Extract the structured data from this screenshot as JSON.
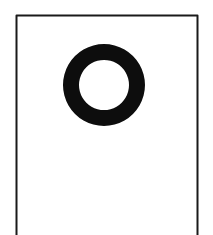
{
  "figure": {
    "colors": {
      "background": "#ffffff",
      "stroke": "#1a1a1a",
      "ring": "#0d0d0d"
    },
    "frame": {
      "left": 16.5,
      "right": 197.5,
      "top": 15.5,
      "bottom_open": true,
      "stroke_width": 2
    },
    "ring": {
      "cx": 104,
      "cy": 85,
      "outer_r": 41,
      "inner_r": 25
    }
  }
}
